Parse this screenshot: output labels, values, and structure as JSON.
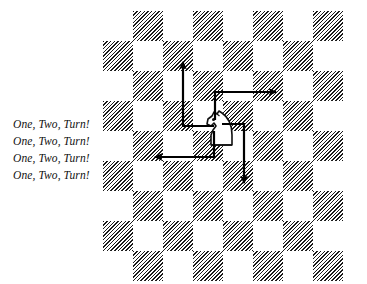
{
  "figure": {
    "type": "chessboard-knight-move-diagram",
    "background_color": "#ffffff",
    "caption_lines": [
      "One, Two, Turn!",
      "One, Two, Turn!",
      "One, Two, Turn!",
      "One, Two, Turn!"
    ],
    "board": {
      "columns": 8,
      "rows": 9,
      "cell_size_px": 30,
      "origin_x_px": 103,
      "origin_y_px": 11,
      "dark_square_color": "#1a1a1a",
      "light_square_color": "#ffffff",
      "dark_square_fill": "diagonal-hatch",
      "hatch_angle_deg": 135,
      "dark_cells": [
        [
          1,
          0
        ],
        [
          3,
          0
        ],
        [
          5,
          0
        ],
        [
          7,
          0
        ],
        [
          0,
          1
        ],
        [
          2,
          1
        ],
        [
          4,
          1
        ],
        [
          6,
          1
        ],
        [
          1,
          2
        ],
        [
          3,
          2
        ],
        [
          5,
          2
        ],
        [
          7,
          2
        ],
        [
          0,
          3
        ],
        [
          2,
          3
        ],
        [
          4,
          3
        ],
        [
          6,
          3
        ],
        [
          1,
          4
        ],
        [
          3,
          4
        ],
        [
          5,
          4
        ],
        [
          7,
          4
        ],
        [
          0,
          5
        ],
        [
          2,
          5
        ],
        [
          4,
          5
        ],
        [
          6,
          5
        ],
        [
          1,
          6
        ],
        [
          3,
          6
        ],
        [
          5,
          6
        ],
        [
          7,
          6
        ],
        [
          0,
          7
        ],
        [
          2,
          7
        ],
        [
          4,
          7
        ],
        [
          6,
          7
        ],
        [
          1,
          8
        ],
        [
          3,
          8
        ],
        [
          5,
          8
        ],
        [
          7,
          8
        ]
      ]
    },
    "piece": {
      "name": "knight",
      "glyph": "white-knight",
      "square_x_px": 200,
      "square_y_px": 107,
      "outline_color": "#111111",
      "fill_color": "#ffffff"
    },
    "moves": [
      {
        "name": "move-up",
        "label": "up-left-then-up",
        "color": "#000000",
        "path": "M 214 126 L 183 126 L 183 62",
        "arrow_tip_x": 183,
        "arrow_tip_y": 55,
        "direction": "up"
      },
      {
        "name": "move-right",
        "label": "up-then-right",
        "color": "#000000",
        "path": "M 215 120 L 215 92 L 276 92",
        "arrow_tip_x": 283,
        "arrow_tip_y": 92,
        "direction": "right"
      },
      {
        "name": "move-left",
        "label": "down-then-left",
        "color": "#000000",
        "path": "M 214 131 L 214 157 L 155 157",
        "arrow_tip_x": 148,
        "arrow_tip_y": 157,
        "direction": "left"
      },
      {
        "name": "move-down",
        "label": "right-then-down",
        "color": "#000000",
        "path": "M 222 124 L 244 124 L 244 183",
        "arrow_tip_x": 244,
        "arrow_tip_y": 190,
        "direction": "down"
      }
    ]
  }
}
